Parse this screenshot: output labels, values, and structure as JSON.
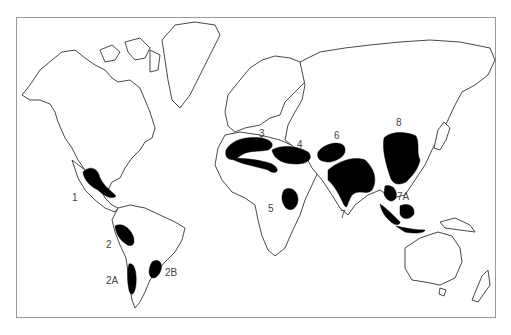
{
  "map": {
    "type": "world outline map",
    "fill_color": "#000000",
    "outline_color": "#333333",
    "regions": [
      {
        "id": "1",
        "label": "1",
        "area": "Mesoamerica (Mexico / Central America)"
      },
      {
        "id": "2",
        "label": "2",
        "area": "Andes (Peru)"
      },
      {
        "id": "2A",
        "label": "2A",
        "area": "Chile"
      },
      {
        "id": "2B",
        "label": "2B",
        "area": "Southern Brazil / Paraguay / Uruguay"
      },
      {
        "id": "3",
        "label": "3",
        "area": "Mediterranean"
      },
      {
        "id": "4",
        "label": "4",
        "area": "Near East / Middle East"
      },
      {
        "id": "5",
        "label": "5",
        "area": "Ethiopia"
      },
      {
        "id": "6",
        "label": "6",
        "area": "Central Asia"
      },
      {
        "id": "7",
        "label": "7",
        "area": "Indian subcontinent / Indo-Burma"
      },
      {
        "id": "7A",
        "label": "7A",
        "area": "Southeast Asia / Malay Archipelago"
      },
      {
        "id": "8",
        "label": "8",
        "area": "China"
      }
    ]
  }
}
